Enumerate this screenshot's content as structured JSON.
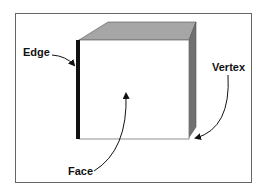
{
  "diagram": {
    "labels": {
      "edge": "Edge",
      "vertex": "Vertex",
      "face": "Face"
    },
    "colors": {
      "top_face": "#a6a6a6",
      "side_face": "#707070",
      "edge_highlight": "#111111",
      "front_face": "#ffffff",
      "frame": "#666666"
    }
  }
}
